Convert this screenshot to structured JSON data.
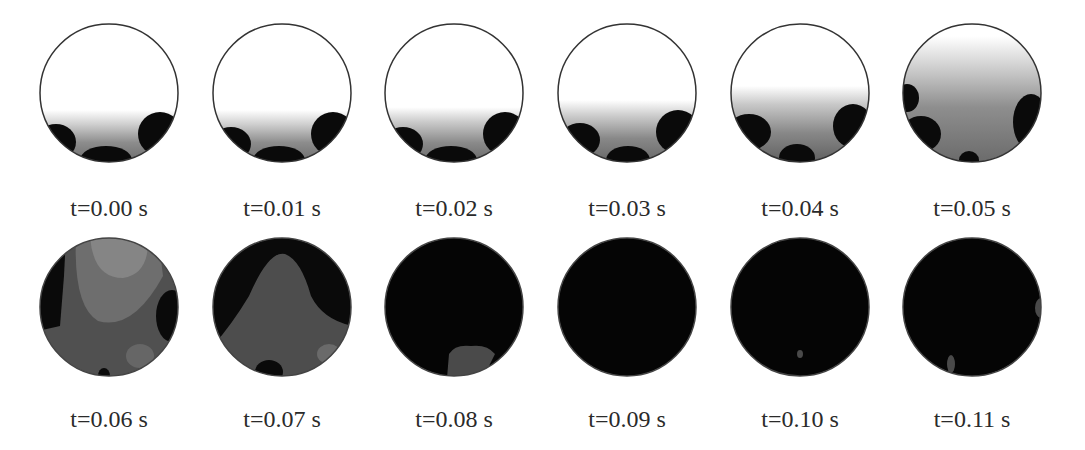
{
  "figure": {
    "colors": {
      "background": "#ffffff",
      "empty": "#ffffff",
      "full": "#050505",
      "mid": "#555555",
      "light": "#8a8a8a",
      "outline": "#333333"
    },
    "frames": [
      {
        "label": "t=0.00 s",
        "row": 0,
        "col": 0
      },
      {
        "label": "t=0.01 s",
        "row": 0,
        "col": 1
      },
      {
        "label": "t=0.02 s",
        "row": 0,
        "col": 2
      },
      {
        "label": "t=0.03 s",
        "row": 0,
        "col": 3
      },
      {
        "label": "t=0.04 s",
        "row": 0,
        "col": 4
      },
      {
        "label": "t=0.05 s",
        "row": 0,
        "col": 5
      },
      {
        "label": "t=0.06 s",
        "row": 1,
        "col": 0
      },
      {
        "label": "t=0.07 s",
        "row": 1,
        "col": 1
      },
      {
        "label": "t=0.08 s",
        "row": 1,
        "col": 2
      },
      {
        "label": "t=0.09 s",
        "row": 1,
        "col": 3
      },
      {
        "label": "t=0.10 s",
        "row": 1,
        "col": 4
      },
      {
        "label": "t=0.11 s",
        "row": 1,
        "col": 5
      }
    ]
  }
}
